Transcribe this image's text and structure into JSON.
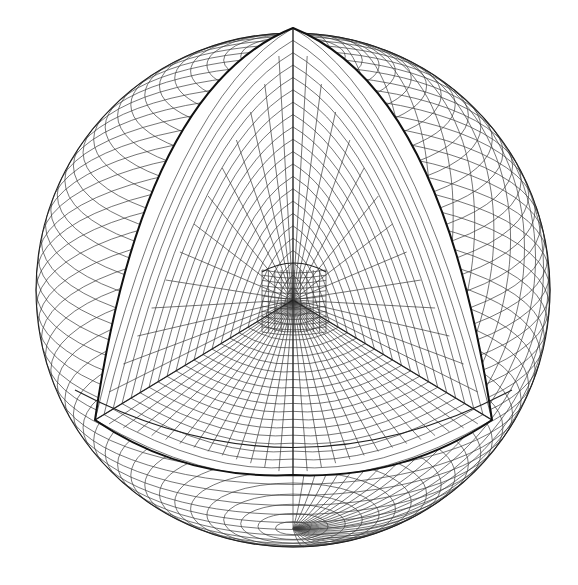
{
  "figure": {
    "title": "",
    "background": "#ffffff",
    "line_color": "#222222"
  },
  "geometry": {
    "sphere": {
      "cx": 293,
      "cy": 290,
      "r": 257
    },
    "pole": {
      "x": 293,
      "y": 28
    },
    "cut_center": {
      "x": 293,
      "y": 300
    },
    "cut_left_corner": {
      "x": 95,
      "y": 420
    },
    "cut_right_corner": {
      "x": 492,
      "y": 420
    },
    "cut_bottom_mid": {
      "x": 293,
      "y": 475
    },
    "core": {
      "x": 262,
      "y": 262,
      "w": 64,
      "h": 70
    },
    "latitude_lines": 46,
    "longitude_lines": 28,
    "cut_face_rings": 22,
    "cut_face_spokes": 14
  }
}
